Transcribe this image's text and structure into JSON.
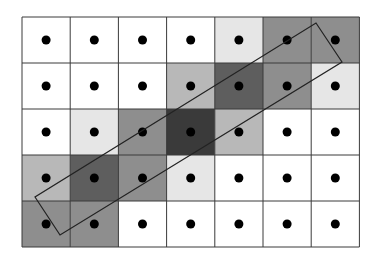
{
  "diagram": {
    "type": "pixel-grid-coverage",
    "grid": {
      "rows": 5,
      "cols": 7,
      "origin_x": 22,
      "origin_y": 17,
      "cell_width": 48.2,
      "cell_height": 46,
      "line_color": "#3a3a3a",
      "dot_color": "#000000",
      "dot_radius": 4.5
    },
    "shade_levels": {
      "0": "#ffffff",
      "1": "#e6e6e6",
      "2": "#b8b8b8",
      "3": "#8e8e8e",
      "4": "#5e5e5e",
      "5": "#3a3a3a"
    },
    "cells": [
      [
        0,
        0,
        0,
        0,
        1,
        3,
        3
      ],
      [
        0,
        0,
        0,
        2,
        4,
        3,
        1
      ],
      [
        0,
        1,
        3,
        5,
        2,
        0,
        0
      ],
      [
        2,
        4,
        3,
        1,
        0,
        0,
        0
      ],
      [
        3,
        3,
        0,
        0,
        0,
        0,
        0
      ]
    ],
    "rectangle": {
      "points": [
        [
          316,
          23
        ],
        [
          342,
          62
        ],
        [
          60,
          235
        ],
        [
          35,
          197
        ]
      ],
      "stroke": "#222222",
      "stroke_width": 1.2
    }
  }
}
